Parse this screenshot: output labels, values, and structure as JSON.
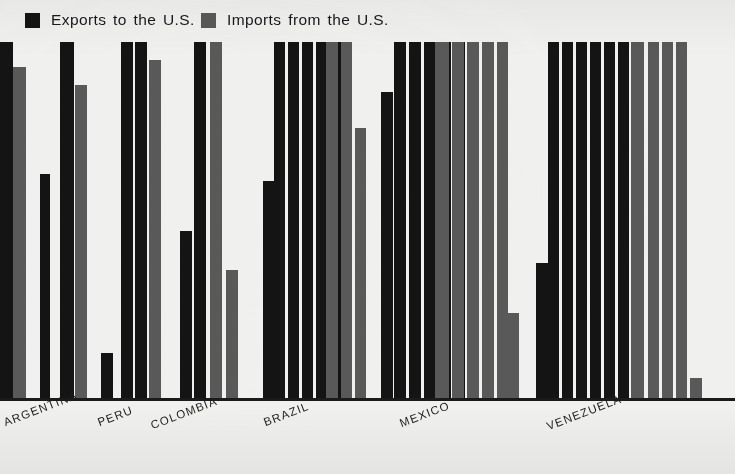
{
  "legend": {
    "exports": {
      "label": "Exports to the U.S.",
      "color": "#141414",
      "swatch": "legend-swatch-black"
    },
    "imports": {
      "label": "Imports from the U.S.",
      "color": "#59595a",
      "swatch": "legend-swatch-gray"
    }
  },
  "axis": {
    "categories": [
      "ARGENTINA",
      "PERU",
      "COLOMBIA",
      "BRAZIL",
      "MEXICO",
      "VENEZUELA"
    ],
    "baseline_color": "#1b1b1b"
  },
  "chart_data": {
    "type": "bar",
    "title": "",
    "subtitle": "",
    "xlabel": "",
    "ylabel": "",
    "grid": false,
    "legend_position": "top-left",
    "note": "Grouped vertical bar chart. Many bars are clipped by the top of the plot area (values exceed the drawn range). Values are percentages of plot height (0-100), estimated from pixel heights; 100 = clipped at top.",
    "ylim": [
      0,
      100
    ],
    "categories": [
      "ARGENTINA",
      "PERU",
      "COLOMBIA",
      "BRAZIL",
      "MEXICO",
      "VENEZUELA"
    ],
    "series": [
      {
        "name": "Exports to the U.S.",
        "color": "#141414"
      },
      {
        "name": "Imports from the U.S.",
        "color": "#59595a"
      }
    ],
    "groups": [
      {
        "category": "ARGENTINA",
        "bars": [
          {
            "series": "Exports to the U.S.",
            "value": 100,
            "clipped": true,
            "x": 0,
            "width": 13
          },
          {
            "series": "Imports from the U.S.",
            "value": 93,
            "clipped": false,
            "x": 13,
            "width": 13
          },
          {
            "series": "Exports to the U.S.",
            "value": 100,
            "clipped": true,
            "x": 60,
            "width": 14
          },
          {
            "series": "Imports from the U.S.",
            "value": 88,
            "clipped": false,
            "x": 75,
            "width": 12
          },
          {
            "series": "Exports to the U.S.",
            "value": 63,
            "clipped": false,
            "x": 40,
            "width": 10
          }
        ]
      },
      {
        "category": "PERU",
        "bars": [
          {
            "series": "Exports to the U.S.",
            "value": 13,
            "clipped": false,
            "x": 101,
            "width": 12
          },
          {
            "series": "Exports to the U.S.",
            "value": 100,
            "clipped": true,
            "x": 121,
            "width": 12
          },
          {
            "series": "Exports to the U.S.",
            "value": 100,
            "clipped": true,
            "x": 135,
            "width": 12
          },
          {
            "series": "Imports from the U.S.",
            "value": 95,
            "clipped": false,
            "x": 149,
            "width": 12
          }
        ]
      },
      {
        "category": "COLOMBIA",
        "bars": [
          {
            "series": "Exports to the U.S.",
            "value": 47,
            "clipped": false,
            "x": 180,
            "width": 12
          },
          {
            "series": "Exports to the U.S.",
            "value": 100,
            "clipped": true,
            "x": 194,
            "width": 12
          },
          {
            "series": "Imports from the U.S.",
            "value": 100,
            "clipped": true,
            "x": 210,
            "width": 12
          },
          {
            "series": "Imports from the U.S.",
            "value": 36,
            "clipped": false,
            "x": 226,
            "width": 12
          }
        ]
      },
      {
        "category": "BRAZIL",
        "bars": [
          {
            "series": "Exports to the U.S.",
            "value": 61,
            "clipped": false,
            "x": 263,
            "width": 12
          },
          {
            "series": "Exports to the U.S.",
            "value": 100,
            "clipped": true,
            "x": 274,
            "width": 11
          },
          {
            "series": "Exports to the U.S.",
            "value": 100,
            "clipped": true,
            "x": 288,
            "width": 11
          },
          {
            "series": "Exports to the U.S.",
            "value": 100,
            "clipped": true,
            "x": 302,
            "width": 11
          },
          {
            "series": "Exports to the U.S.",
            "value": 100,
            "clipped": true,
            "x": 316,
            "width": 11
          },
          {
            "series": "Exports to the U.S.",
            "value": 100,
            "clipped": true,
            "x": 330,
            "width": 11
          },
          {
            "series": "Imports from the U.S.",
            "value": 100,
            "clipped": true,
            "x": 326,
            "width": 12
          },
          {
            "series": "Imports from the U.S.",
            "value": 100,
            "clipped": true,
            "x": 341,
            "width": 11
          },
          {
            "series": "Imports from the U.S.",
            "value": 76,
            "clipped": false,
            "x": 355,
            "width": 11
          }
        ]
      },
      {
        "category": "MEXICO",
        "bars": [
          {
            "series": "Exports to the U.S.",
            "value": 86,
            "clipped": false,
            "x": 381,
            "width": 12
          },
          {
            "series": "Exports to the U.S.",
            "value": 100,
            "clipped": true,
            "x": 394,
            "width": 12
          },
          {
            "series": "Exports to the U.S.",
            "value": 100,
            "clipped": true,
            "x": 409,
            "width": 12
          },
          {
            "series": "Exports to the U.S.",
            "value": 100,
            "clipped": true,
            "x": 424,
            "width": 12
          },
          {
            "series": "Exports to the U.S.",
            "value": 100,
            "clipped": true,
            "x": 439,
            "width": 12
          },
          {
            "series": "Exports to the U.S.",
            "value": 100,
            "clipped": true,
            "x": 453,
            "width": 12
          },
          {
            "series": "Imports from the U.S.",
            "value": 100,
            "clipped": true,
            "x": 435,
            "width": 14
          },
          {
            "series": "Imports from the U.S.",
            "value": 100,
            "clipped": true,
            "x": 452,
            "width": 12
          },
          {
            "series": "Imports from the U.S.",
            "value": 100,
            "clipped": true,
            "x": 467,
            "width": 12
          },
          {
            "series": "Imports from the U.S.",
            "value": 100,
            "clipped": true,
            "x": 482,
            "width": 12
          },
          {
            "series": "Imports from the U.S.",
            "value": 100,
            "clipped": true,
            "x": 497,
            "width": 11
          },
          {
            "series": "Imports from the U.S.",
            "value": 24,
            "clipped": false,
            "x": 507,
            "width": 12
          }
        ]
      },
      {
        "category": "VENEZUELA",
        "bars": [
          {
            "series": "Exports to the U.S.",
            "value": 38,
            "clipped": false,
            "x": 536,
            "width": 12
          },
          {
            "series": "Exports to the U.S.",
            "value": 100,
            "clipped": true,
            "x": 548,
            "width": 11
          },
          {
            "series": "Exports to the U.S.",
            "value": 100,
            "clipped": true,
            "x": 562,
            "width": 11
          },
          {
            "series": "Exports to the U.S.",
            "value": 100,
            "clipped": true,
            "x": 576,
            "width": 11
          },
          {
            "series": "Exports to the U.S.",
            "value": 100,
            "clipped": true,
            "x": 590,
            "width": 11
          },
          {
            "series": "Exports to the U.S.",
            "value": 100,
            "clipped": true,
            "x": 604,
            "width": 11
          },
          {
            "series": "Exports to the U.S.",
            "value": 100,
            "clipped": true,
            "x": 618,
            "width": 11
          },
          {
            "series": "Imports from the U.S.",
            "value": 100,
            "clipped": true,
            "x": 631,
            "width": 13
          },
          {
            "series": "Imports from the U.S.",
            "value": 100,
            "clipped": true,
            "x": 648,
            "width": 11
          },
          {
            "series": "Imports from the U.S.",
            "value": 100,
            "clipped": true,
            "x": 662,
            "width": 11
          },
          {
            "series": "Imports from the U.S.",
            "value": 100,
            "clipped": true,
            "x": 676,
            "width": 11
          },
          {
            "series": "Imports from the U.S.",
            "value": 6,
            "clipped": false,
            "x": 690,
            "width": 12
          }
        ]
      }
    ],
    "label_positions": [
      {
        "label": "ARGENTINA",
        "x": 2,
        "y": 18
      },
      {
        "label": "PERU",
        "x": 96,
        "y": 18
      },
      {
        "label": "COLOMBIA",
        "x": 149,
        "y": 21
      },
      {
        "label": "BRAZIL",
        "x": 262,
        "y": 18
      },
      {
        "label": "MEXICO",
        "x": 398,
        "y": 19
      },
      {
        "label": "VENEZUELA",
        "x": 545,
        "y": 22
      }
    ]
  }
}
